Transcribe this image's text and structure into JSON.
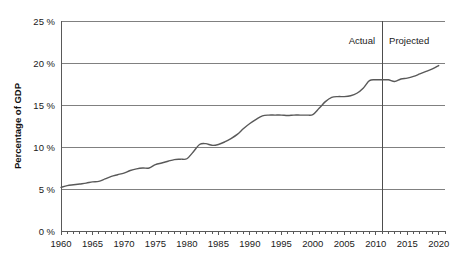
{
  "chart_data": {
    "type": "line",
    "title": "",
    "subtitle": "",
    "xlabel": "",
    "ylabel": "Percentage of GDP",
    "xlim": [
      1960,
      2021
    ],
    "ylim": [
      0,
      25
    ],
    "grid": true,
    "grid_axis": "y",
    "legend": "none",
    "y_tick_labels": [
      "25 %",
      "20 %",
      "15 %",
      "10 %",
      "5 %",
      "0 %"
    ],
    "y_ticks": [
      25,
      20,
      15,
      10,
      5,
      0
    ],
    "x_tick_labels": [
      "1960",
      "1965",
      "1970",
      "1975",
      "1980",
      "1985",
      "1990",
      "1995",
      "2000",
      "2005",
      "2010",
      "2015",
      "2020"
    ],
    "x_ticks": [
      1960,
      1965,
      1970,
      1975,
      1980,
      1985,
      1990,
      1995,
      2000,
      2005,
      2010,
      2015,
      2020
    ],
    "x_minor_tick_step": 1,
    "annotations": [
      {
        "text": "Actual",
        "x": 2011,
        "y": 22.3,
        "align": "right"
      },
      {
        "text": "Projected",
        "x": 2011,
        "y": 22.3,
        "align": "left"
      }
    ],
    "divider": {
      "x": 2011,
      "label_left": "Actual",
      "label_right": "Projected"
    },
    "line_color": "#595959",
    "grid_color": "#808080",
    "axis_color": "#595959",
    "series": [
      {
        "name": "Percentage of GDP",
        "x": [
          1960,
          1961,
          1962,
          1963,
          1964,
          1965,
          1966,
          1967,
          1968,
          1969,
          1970,
          1971,
          1972,
          1973,
          1974,
          1975,
          1976,
          1977,
          1978,
          1979,
          1980,
          1981,
          1982,
          1983,
          1984,
          1985,
          1986,
          1987,
          1988,
          1989,
          1990,
          1991,
          1992,
          1993,
          1994,
          1995,
          1996,
          1997,
          1998,
          1999,
          2000,
          2001,
          2002,
          2003,
          2004,
          2005,
          2006,
          2007,
          2008,
          2009,
          2010,
          2011,
          2012,
          2013,
          2014,
          2015,
          2016,
          2017,
          2018,
          2019,
          2020
        ],
        "values": [
          5.2,
          5.4,
          5.5,
          5.6,
          5.7,
          5.85,
          5.9,
          6.2,
          6.5,
          6.7,
          6.9,
          7.2,
          7.4,
          7.5,
          7.5,
          7.9,
          8.1,
          8.3,
          8.5,
          8.55,
          8.6,
          9.4,
          10.3,
          10.4,
          10.2,
          10.3,
          10.6,
          11.0,
          11.5,
          12.2,
          12.8,
          13.3,
          13.7,
          13.8,
          13.8,
          13.8,
          13.75,
          13.8,
          13.8,
          13.8,
          13.85,
          14.6,
          15.4,
          15.9,
          16.0,
          16.0,
          16.1,
          16.4,
          17.0,
          17.9,
          18.0,
          18.0,
          18.0,
          17.8,
          18.1,
          18.2,
          18.4,
          18.7,
          19.0,
          19.3,
          19.7
        ]
      }
    ]
  },
  "plot_geometry": {
    "left": 61,
    "right": 445,
    "top": 21,
    "bottom": 231
  }
}
